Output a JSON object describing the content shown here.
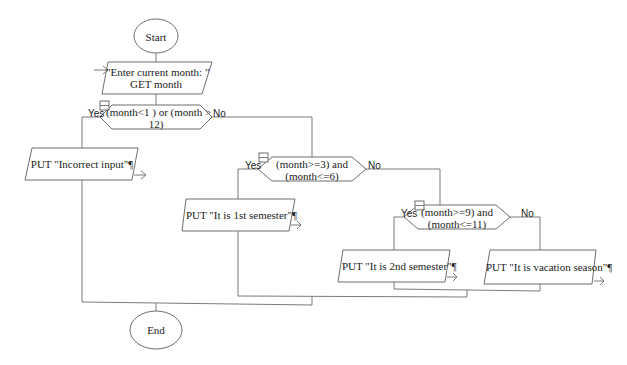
{
  "flowchart": {
    "start": {
      "label": "Start"
    },
    "end": {
      "label": "End"
    },
    "input": {
      "line1": "\"Enter current month: \"",
      "line2": "GET month"
    },
    "decisions": [
      {
        "line1": "(month<1 ) or (month >",
        "line2": "12)",
        "yes": "Yes",
        "no": "No"
      },
      {
        "line1": "(month>=3) and",
        "line2": "(month<=6)",
        "yes": "Yes",
        "no": "No"
      },
      {
        "line1": "(month>=9) and",
        "line2": "(month<=11)",
        "yes": "Yes",
        "no": "No"
      }
    ],
    "outputs": [
      {
        "label": "PUT \"Incorrect input\"¶"
      },
      {
        "label": "PUT \"It is 1st semester\"¶"
      },
      {
        "label": "PUT \"It is 2nd semester\"¶"
      },
      {
        "label": "PUT \"It is vacation season\"¶"
      }
    ]
  }
}
